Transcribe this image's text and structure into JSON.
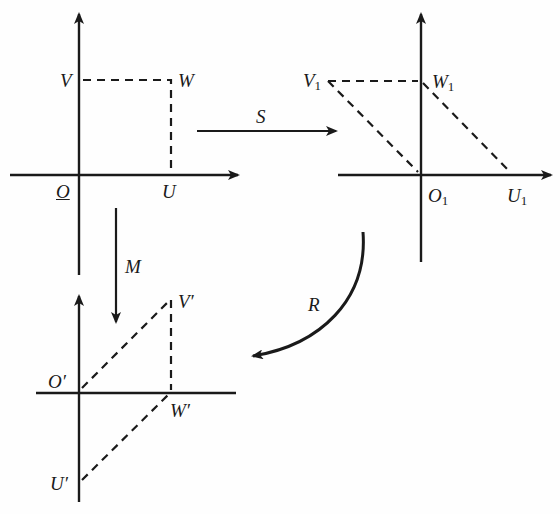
{
  "diagram": {
    "panels": [
      {
        "id": "original",
        "labels": {
          "origin": "O",
          "u": "U",
          "v": "V",
          "w": "W"
        }
      },
      {
        "id": "sheared",
        "labels": {
          "origin": "O",
          "u": "U",
          "v": "V",
          "w": "W",
          "sub": "1"
        }
      },
      {
        "id": "mapped",
        "labels": {
          "origin": "O′",
          "u": "U′",
          "v": "V′",
          "w": "W′"
        }
      }
    ],
    "arrows": {
      "S": "S",
      "M": "M",
      "R": "R"
    },
    "colors": {
      "ink": "#1a1a1a",
      "background": "#fefefe"
    }
  }
}
